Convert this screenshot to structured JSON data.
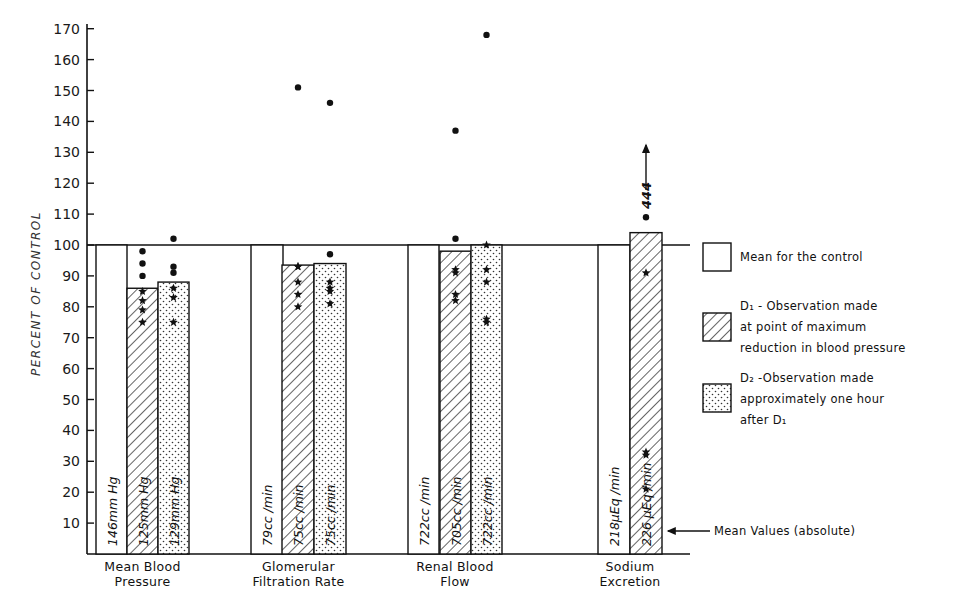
{
  "chart_data": {
    "type": "bar",
    "title": "",
    "xlabel": "",
    "ylabel": "PERCENT OF CONTROL",
    "ylim": [
      0,
      170
    ],
    "yticks": [
      10,
      20,
      30,
      40,
      50,
      60,
      70,
      80,
      90,
      100,
      110,
      120,
      130,
      140,
      150,
      160,
      170
    ],
    "grid": false,
    "legend_position": "right",
    "categories": [
      "Mean Blood Pressure",
      "Glomerular Filtration Rate",
      "Renal Blood Flow",
      "Sodium Excretion"
    ],
    "category_label_lines": [
      [
        "Mean Blood",
        "Pressure"
      ],
      [
        "Glomerular",
        "Filtration Rate"
      ],
      [
        "Renal Blood",
        "Flow"
      ],
      [
        "Sodium",
        "Excretion"
      ]
    ],
    "series": [
      {
        "name": "Mean for the control",
        "pattern": "blank",
        "values": [
          100,
          100,
          100,
          100
        ],
        "absolute_labels": [
          "146mm Hg",
          "79cc /min",
          "722cc /min",
          "218μEq /min"
        ]
      },
      {
        "name": "D1 - Observation made at point of maximum reduction in blood pressure",
        "pattern": "hatch",
        "values": [
          86,
          93.5,
          98,
          104
        ],
        "absolute_labels": [
          "125mm Hg",
          "75cc /min",
          "705cc /min",
          "226 μEq /min"
        ]
      },
      {
        "name": "D2 - Observation made approximately one hour after D1",
        "pattern": "dots",
        "values": [
          88,
          94,
          100,
          null
        ],
        "absolute_labels": [
          "129mm Hg",
          "75cc /min",
          "722cc /min",
          null
        ]
      }
    ],
    "individual_points": [
      {
        "category": "Mean Blood Pressure",
        "series": "D1",
        "values": [
          98,
          94,
          90,
          85,
          82,
          79,
          75
        ]
      },
      {
        "category": "Mean Blood Pressure",
        "series": "D2",
        "values": [
          102,
          93,
          91,
          86,
          83,
          75
        ]
      },
      {
        "category": "Glomerular Filtration Rate",
        "series": "D1",
        "values": [
          151,
          93,
          93,
          88,
          84,
          80
        ]
      },
      {
        "category": "Glomerular Filtration Rate",
        "series": "D2",
        "values": [
          146,
          97,
          88,
          86,
          85,
          81
        ]
      },
      {
        "category": "Renal Blood Flow",
        "series": "D1",
        "values": [
          137,
          102,
          92,
          91,
          84,
          82
        ]
      },
      {
        "category": "Renal Blood Flow",
        "series": "D2",
        "values": [
          168,
          100,
          92,
          88,
          76,
          75
        ]
      },
      {
        "category": "Sodium Excretion",
        "series": "D1",
        "values": [
          444,
          109,
          91,
          33,
          32,
          21
        ]
      }
    ],
    "annotations": [
      {
        "text": "444",
        "note": "off-scale value with upward arrow above Sodium Excretion D1"
      },
      {
        "text": "Mean Values (absolute)",
        "note": "arrow pointing to absolute value labels in bars"
      }
    ]
  },
  "axis": {
    "ylabel": "PERCENT OF CONTROL",
    "ticks": [
      "10",
      "20",
      "30",
      "40",
      "50",
      "60",
      "70",
      "80",
      "90",
      "100",
      "110",
      "120",
      "130",
      "140",
      "150",
      "160",
      "170"
    ]
  },
  "legend": {
    "items": [
      {
        "key": "control",
        "lines": [
          "Mean for the control"
        ]
      },
      {
        "key": "d1",
        "lines": [
          "D₁ - Observation made",
          "at point of maximum",
          "reduction in blood pressure"
        ]
      },
      {
        "key": "d2",
        "lines": [
          "D₂ -Observation made",
          "approximately one hour",
          "after D₁"
        ]
      }
    ]
  },
  "annotation": {
    "off_scale": "444",
    "mean_values": "Mean Values (absolute)"
  },
  "colors": {
    "ink": "#111111",
    "background": "#ffffff"
  }
}
